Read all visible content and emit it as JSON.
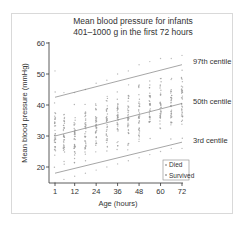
{
  "chart_data": {
    "type": "scatter",
    "title": "Mean blood pressure for infants",
    "subtitle": "401–1000 g in the first 72 hours",
    "xlabel": "Age (hours)",
    "ylabel": "Mean blood pressure (mmHg)",
    "xticks": [
      1,
      12,
      24,
      36,
      48,
      60,
      72
    ],
    "yticks": [
      20,
      30,
      40,
      50,
      60
    ],
    "xlim": [
      1,
      72
    ],
    "ylim": [
      15,
      60
    ],
    "grid": false,
    "legend": {
      "position": "lower right",
      "entries": [
        "Died",
        "Survived"
      ]
    },
    "centile_lines": [
      {
        "name": "97th centile",
        "x": [
          1,
          72
        ],
        "y": [
          42.5,
          53
        ]
      },
      {
        "name": "50th centile",
        "x": [
          1,
          72
        ],
        "y": [
          30,
          40.5
        ]
      },
      {
        "name": "3rd centile",
        "x": [
          1,
          72
        ],
        "y": [
          18,
          28
        ]
      }
    ],
    "scatter_columns_hours": [
      1,
      6,
      12,
      18,
      24,
      30,
      36,
      42,
      48,
      54,
      60,
      66,
      72
    ],
    "scatter_ranges": [
      {
        "x": 1,
        "ymin": 15,
        "ymax": 51
      },
      {
        "x": 6,
        "ymin": 16,
        "ymax": 44
      },
      {
        "x": 12,
        "ymin": 17,
        "ymax": 44
      },
      {
        "x": 18,
        "ymin": 18,
        "ymax": 45
      },
      {
        "x": 24,
        "ymin": 19,
        "ymax": 47
      },
      {
        "x": 30,
        "ymin": 20,
        "ymax": 48
      },
      {
        "x": 36,
        "ymin": 21,
        "ymax": 50
      },
      {
        "x": 42,
        "ymin": 22,
        "ymax": 51
      },
      {
        "x": 48,
        "ymin": 23,
        "ymax": 53
      },
      {
        "x": 54,
        "ymin": 24,
        "ymax": 54
      },
      {
        "x": 60,
        "ymin": 25,
        "ymax": 55
      },
      {
        "x": 66,
        "ymin": 26,
        "ymax": 55
      },
      {
        "x": 72,
        "ymin": 26,
        "ymax": 56
      }
    ],
    "annotations": [
      "97th centile",
      "50th centile",
      "3rd centile"
    ]
  },
  "colors": {
    "points": "#9a9a9a",
    "lines": "#7f7f7f",
    "axis": "#333333",
    "frame": "#d9d9d9"
  }
}
